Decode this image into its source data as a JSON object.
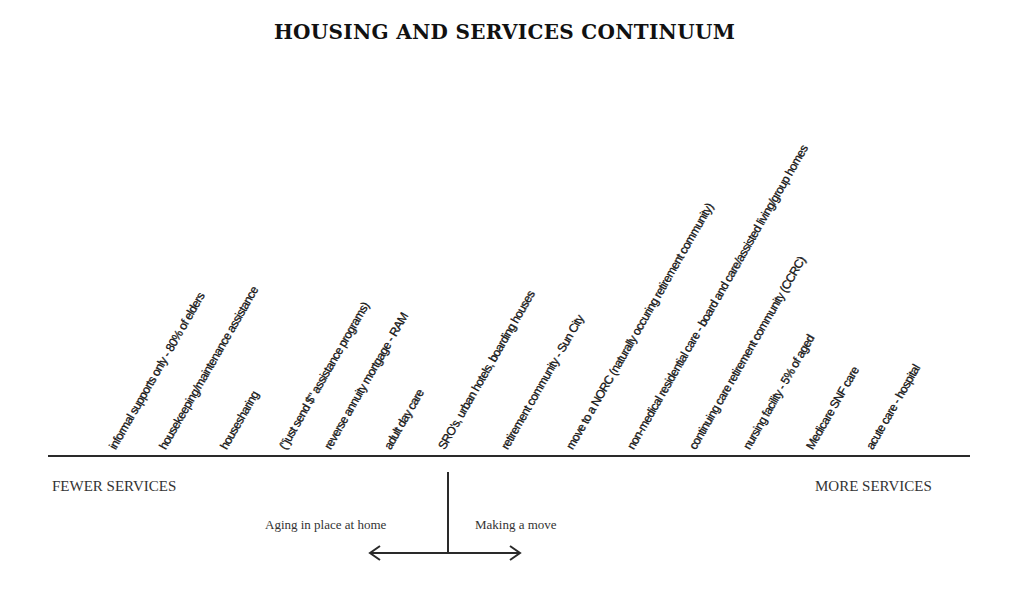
{
  "title": "HOUSING AND SERVICES CONTINUUM",
  "continuum": {
    "left_end": "FEWER SERVICES",
    "right_end": "MORE SERVICES",
    "items": [
      {
        "label": "informal supports only - 80% of elders",
        "x": 118
      },
      {
        "label": "housekeeping/maintenance assistance",
        "x": 168
      },
      {
        "label": "housesharing",
        "x": 229
      },
      {
        "label": "(\"just send $\" assistance programs)",
        "x": 288
      },
      {
        "label": "reverse annuity mortgage - RAM",
        "x": 333
      },
      {
        "label": "adult day care",
        "x": 393
      },
      {
        "label": "SRO's, urban hotels, boarding houses",
        "x": 447
      },
      {
        "label": "retirement community - Sun City",
        "x": 510
      },
      {
        "label": "move to a NORC (naturally occuring retirement community)",
        "x": 575
      },
      {
        "label": "non-medical residential care - board and care/assisted living/group homes",
        "x": 636
      },
      {
        "label": "continuing care retirement community (CCRC)",
        "x": 698
      },
      {
        "label": "nursing facility - 5% of aged",
        "x": 752
      },
      {
        "label": "Medicare SNF care",
        "x": 815
      },
      {
        "label": "acute care - hospital",
        "x": 875
      }
    ]
  },
  "branch": {
    "left_label": "Aging in place at home",
    "right_label": "Making a move"
  }
}
